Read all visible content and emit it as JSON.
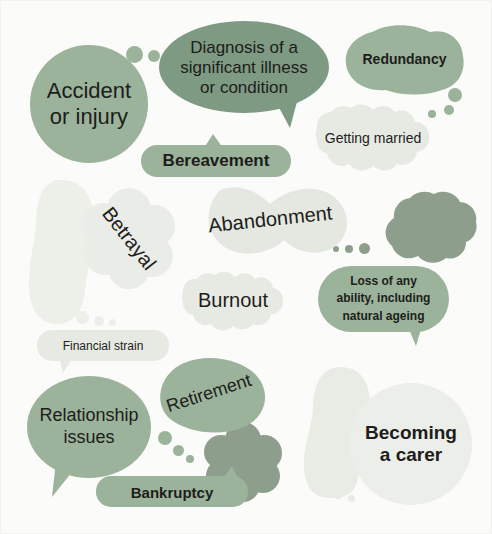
{
  "canvas": {
    "width": 492,
    "height": 534,
    "background": "#fbfbfa"
  },
  "palette": {
    "green_mid": "#9bb39a",
    "green_deep": "#7f9a82",
    "green_pale": "#e4eae2",
    "green_paler": "#eef1ec",
    "grey_pale": "#e9ebe7",
    "text_dark": "#1d1d1b"
  },
  "bubbles": [
    {
      "id": "accident-or-injury",
      "label": "Accident\nor injury",
      "line1": "Accident",
      "line2": "or injury",
      "shape": "thought-circle",
      "color": "#9bb39a",
      "weight": "light",
      "font_size": 22,
      "rotation": 0
    },
    {
      "id": "diagnosis",
      "label": "Diagnosis of a significant illness or condition",
      "line1": "Diagnosis of a",
      "line2": "significant illness",
      "line3": "or condition",
      "shape": "speech-oval",
      "color": "#7f9a82",
      "weight": "light",
      "font_size": 17,
      "rotation": 0
    },
    {
      "id": "redundancy",
      "label": "Redundancy",
      "shape": "thought-blob",
      "color": "#9bb39a",
      "weight": "bold",
      "font_size": 14,
      "rotation": 0
    },
    {
      "id": "getting-married",
      "label": "Getting married",
      "shape": "cloud",
      "color": "#e7eae3",
      "weight": "light",
      "font_size": 14,
      "rotation": 0
    },
    {
      "id": "bereavement",
      "label": "Bereavement",
      "shape": "pill-tail-up",
      "color": "#9bb39a",
      "weight": "bold",
      "font_size": 17,
      "rotation": 0
    },
    {
      "id": "betrayal",
      "label": "Betrayal",
      "shape": "flower",
      "color": "#eaece7",
      "weight": "light",
      "font_size": 20,
      "rotation": 52
    },
    {
      "id": "abandonment",
      "label": "Abandonment",
      "shape": "peanut",
      "color": "#e4e8e1",
      "weight": "light",
      "font_size": 20,
      "rotation": -6
    },
    {
      "id": "left-blob",
      "label": "",
      "shape": "thought-bean",
      "color": "#edefe9",
      "weight": "light",
      "font_size": 0,
      "rotation": 0
    },
    {
      "id": "dark-cloud-right",
      "label": "",
      "shape": "cloud-dark",
      "color": "#8d9e8c",
      "weight": "light",
      "font_size": 0,
      "rotation": 0
    },
    {
      "id": "burnout",
      "label": "Burnout",
      "shape": "cloud",
      "color": "#e7eae3",
      "weight": "light",
      "font_size": 20,
      "rotation": 0
    },
    {
      "id": "loss-of-ability",
      "label": "Loss of any ability, including natural ageing",
      "line1": "Loss of any",
      "line2": "ability, including",
      "line3": "natural ageing",
      "shape": "speech-oval-sm",
      "color": "#9bb39a",
      "weight": "bold",
      "font_size": 12,
      "rotation": 0
    },
    {
      "id": "financial-strain",
      "label": "Financial strain",
      "shape": "pill-tail-down",
      "color": "#e7eae3",
      "weight": "light",
      "font_size": 12,
      "rotation": 0
    },
    {
      "id": "relationship-issues",
      "label": "Relationship issues",
      "line1": "Relationship",
      "line2": "issues",
      "shape": "speech-round",
      "color": "#9bb39a",
      "weight": "light",
      "font_size": 18,
      "rotation": 0
    },
    {
      "id": "retirement",
      "label": "Retirement",
      "shape": "thought-oval",
      "color": "#9bb39a",
      "weight": "light",
      "font_size": 18,
      "rotation": -18
    },
    {
      "id": "bankruptcy",
      "label": "Bankruptcy",
      "shape": "pill-tail-up-right",
      "color": "#9bb39a",
      "weight": "bold",
      "font_size": 15,
      "rotation": 0
    },
    {
      "id": "flower-dark-bottom",
      "label": "",
      "shape": "flower-dark",
      "color": "#8d9e8c",
      "weight": "light",
      "font_size": 0,
      "rotation": 0
    },
    {
      "id": "becoming-a-carer",
      "label": "Becoming a carer",
      "line1": "Becoming",
      "line2": "a carer",
      "shape": "circle",
      "color": "#eceee9",
      "weight": "bold",
      "font_size": 19,
      "rotation": 0
    },
    {
      "id": "pale-bean-bottom-right",
      "label": "",
      "shape": "thought-bean2",
      "color": "#e9ece5",
      "weight": "light",
      "font_size": 0,
      "rotation": 0
    }
  ]
}
